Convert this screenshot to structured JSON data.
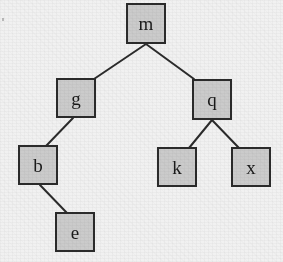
{
  "figure": {
    "width": 283,
    "height": 262,
    "background_color": "#f1f1f1",
    "node_fill_color": "#cbcbcb",
    "node_border_color": "#2b2b2b",
    "edge_color": "#2b2b2b",
    "label_color": "#1a1a1a"
  },
  "tree": {
    "root": "m",
    "nodes": [
      {
        "id": "m",
        "label": "m",
        "x": 126,
        "y": 3,
        "w": 40,
        "h": 41,
        "level": 0,
        "parent": null,
        "side": null
      },
      {
        "id": "g",
        "label": "g",
        "x": 56,
        "y": 78,
        "w": 40,
        "h": 40,
        "level": 1,
        "parent": "m",
        "side": "left"
      },
      {
        "id": "q",
        "label": "q",
        "x": 192,
        "y": 79,
        "w": 40,
        "h": 41,
        "level": 1,
        "parent": "m",
        "side": "right"
      },
      {
        "id": "b",
        "label": "b",
        "x": 18,
        "y": 145,
        "w": 40,
        "h": 40,
        "level": 2,
        "parent": "g",
        "side": "left"
      },
      {
        "id": "k",
        "label": "k",
        "x": 157,
        "y": 147,
        "w": 40,
        "h": 40,
        "level": 2,
        "parent": "q",
        "side": "left"
      },
      {
        "id": "x",
        "label": "x",
        "x": 231,
        "y": 147,
        "w": 40,
        "h": 40,
        "level": 2,
        "parent": "q",
        "side": "right"
      },
      {
        "id": "e",
        "label": "e",
        "x": 55,
        "y": 212,
        "w": 40,
        "h": 40,
        "level": 3,
        "parent": "b",
        "side": "right"
      }
    ],
    "edges": [
      {
        "from": "m",
        "to": "g",
        "x1": 146,
        "y1": 44,
        "x2": 94,
        "y2": 79
      },
      {
        "from": "m",
        "to": "q",
        "x1": 146,
        "y1": 44,
        "x2": 194,
        "y2": 79
      },
      {
        "from": "g",
        "to": "b",
        "x1": 73,
        "y1": 118,
        "x2": 46,
        "y2": 146
      },
      {
        "from": "b",
        "to": "e",
        "x1": 40,
        "y1": 185,
        "x2": 67,
        "y2": 213
      },
      {
        "from": "q",
        "to": "k",
        "x1": 212,
        "y1": 120,
        "x2": 189,
        "y2": 148
      },
      {
        "from": "q",
        "to": "x",
        "x1": 212,
        "y1": 120,
        "x2": 239,
        "y2": 148
      }
    ]
  },
  "artifacts": [
    {
      "name": "scan-speck",
      "x": 2,
      "y": 18,
      "w": 2,
      "h": 3
    }
  ]
}
